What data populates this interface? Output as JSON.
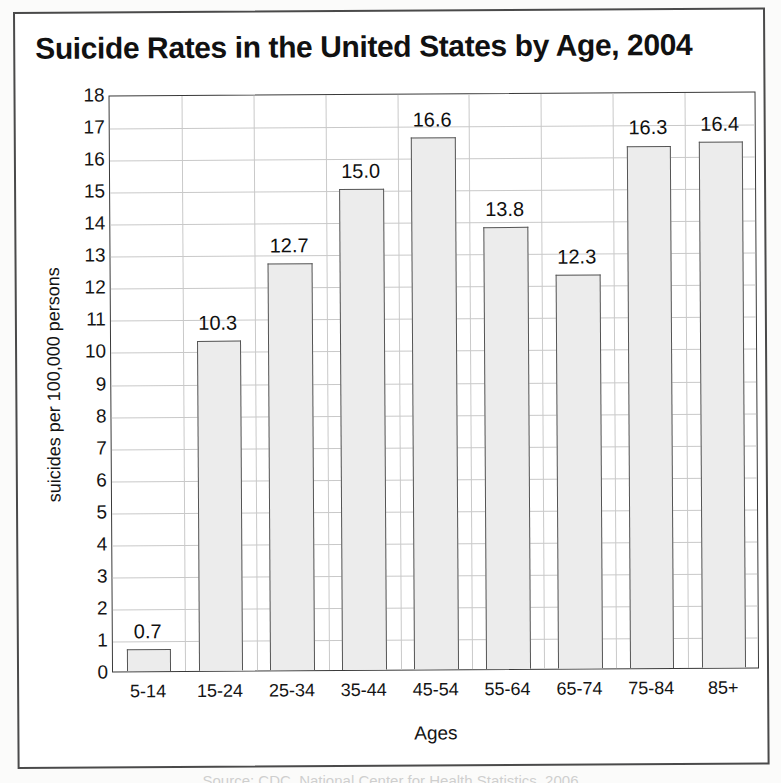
{
  "figure": {
    "title": "Suicide Rates in the United States by Age, 2004",
    "bottom_caption": "Source: CDC, National Center for Health Statistics, 2006"
  },
  "chart_data": {
    "type": "bar",
    "title": "Suicide Rates in the United States by Age, 2004",
    "xlabel": "Ages",
    "ylabel": "suicides per 100,000 persons",
    "categories": [
      "5-14",
      "15-24",
      "25-34",
      "35-44",
      "45-54",
      "55-64",
      "65-74",
      "75-84",
      "85+"
    ],
    "values": [
      0.7,
      10.3,
      12.7,
      15.0,
      16.6,
      13.8,
      12.3,
      16.3,
      16.4
    ],
    "value_labels": [
      "0.7",
      "10.3",
      "12.7",
      "15.0",
      "16.6",
      "13.8",
      "12.3",
      "16.3",
      "16.4"
    ],
    "ylim": [
      0,
      18
    ],
    "ytick_step": 1,
    "yticks": [
      0,
      1,
      2,
      3,
      4,
      5,
      6,
      7,
      8,
      9,
      10,
      11,
      12,
      13,
      14,
      15,
      16,
      17,
      18
    ],
    "ytick_labels": [
      "0",
      "1",
      "2",
      "3",
      "4",
      "5",
      "6",
      "7",
      "8",
      "9",
      "10",
      "11",
      "12",
      "13",
      "14",
      "15",
      "16",
      "17",
      "18"
    ],
    "grid": true,
    "grid_axis": "y",
    "legend": null,
    "bar_fill_color": "#ececec",
    "bar_border_color": "#555555",
    "gridline_color": "#c9c9c9",
    "axis_color": "#3a3a3a",
    "background_color": "#ffffff"
  }
}
